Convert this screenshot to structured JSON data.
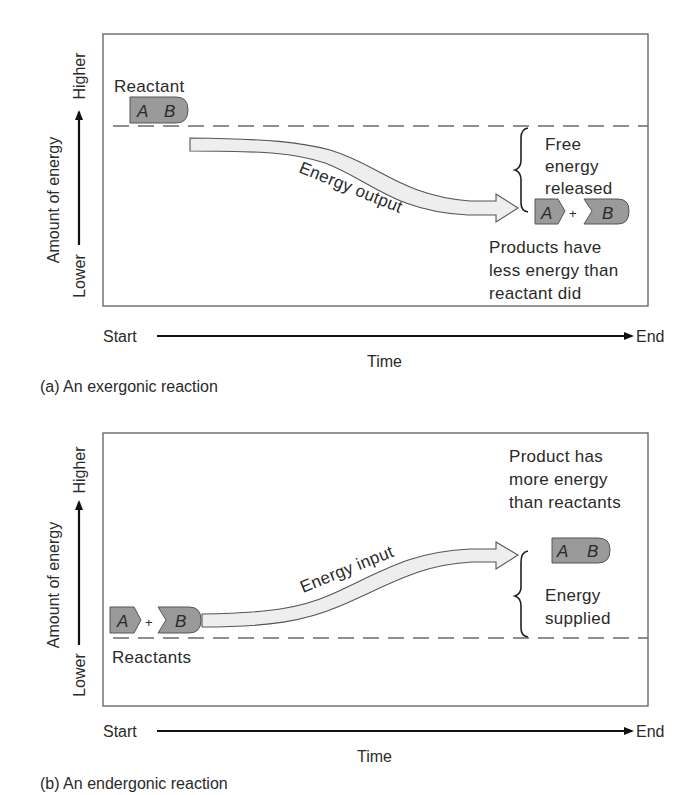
{
  "panel_a": {
    "caption": "(a) An exergonic reaction",
    "y_axis": {
      "label": "Amount of energy",
      "high": "Higher",
      "low": "Lower"
    },
    "x_axis": {
      "start": "Start",
      "end": "End",
      "label": "Time"
    },
    "reactant_label": "Reactant",
    "reactant_molecule": {
      "a": "A",
      "b": "B"
    },
    "arrow_label": "Energy output",
    "brace_label": [
      "Free",
      "energy",
      "released"
    ],
    "products": {
      "a": "A",
      "plus": "+",
      "b": "B"
    },
    "products_note": [
      "Products have",
      "less energy than",
      "reactant did"
    ]
  },
  "panel_b": {
    "caption": "(b) An endergonic reaction",
    "y_axis": {
      "label": "Amount of energy",
      "high": "Higher",
      "low": "Lower"
    },
    "x_axis": {
      "start": "Start",
      "end": "End",
      "label": "Time"
    },
    "reactants_label": "Reactants",
    "reactants": {
      "a": "A",
      "plus": "+",
      "b": "B"
    },
    "arrow_label": "Energy input",
    "product_molecule": {
      "a": "A",
      "b": "B"
    },
    "product_note": [
      "Product has",
      "more energy",
      "than reactants"
    ],
    "brace_label": [
      "Energy",
      "supplied"
    ]
  },
  "colors": {
    "molecule_fill": "#9a9a9a",
    "arrow_fill": "#eeeeee",
    "box_stroke": "#6a6a6a",
    "text": "#2a2a2a"
  }
}
